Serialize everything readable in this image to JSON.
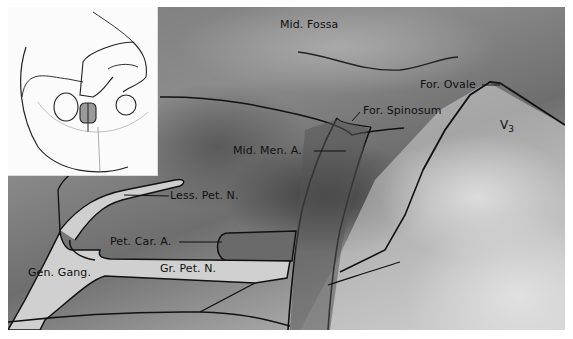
{
  "figure": {
    "inset": {
      "content": "skull orientation sketch with highlighted exposure area"
    },
    "labels": [
      {
        "id": "mid-fossa",
        "text": "Mid. Fossa"
      },
      {
        "id": "for-ovale",
        "text": "For. Ovale"
      },
      {
        "id": "for-spinosum",
        "text": "For. Spinosum"
      },
      {
        "id": "v3",
        "text": "V",
        "sub": "3"
      },
      {
        "id": "mid-men-a",
        "text": "Mid. Men. A."
      },
      {
        "id": "less-pet-n",
        "text": "Less. Pet. N."
      },
      {
        "id": "pet-car-a",
        "text": "Pet. Car. A."
      },
      {
        "id": "gen-gang",
        "text": "Gen. Gang."
      },
      {
        "id": "gr-pet-n",
        "text": "Gr. Pet. N."
      }
    ]
  }
}
